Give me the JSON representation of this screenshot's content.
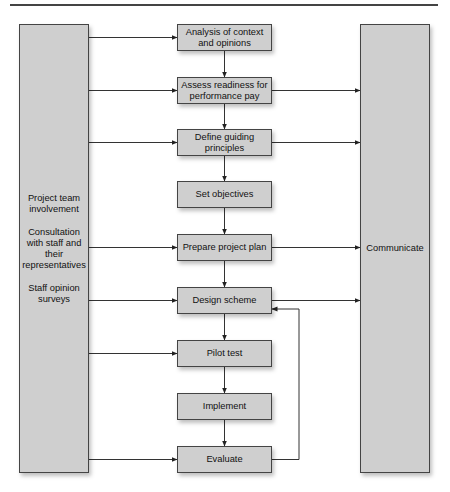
{
  "diagram": {
    "left_panel": {
      "groups": [
        {
          "lines": [
            "Project team",
            "involvement"
          ]
        },
        {
          "lines": [
            "Consultation",
            "with staff and",
            "their",
            "representatives"
          ]
        },
        {
          "lines": [
            "Staff opinion",
            "surveys"
          ]
        }
      ]
    },
    "right_panel": {
      "label": "Communicate"
    },
    "steps": [
      {
        "lines": [
          "Analysis of context",
          "and opinions"
        ],
        "top": 24,
        "from_left": true,
        "to_right": false
      },
      {
        "lines": [
          "Assess readiness for",
          "performance pay"
        ],
        "top": 77,
        "from_left": true,
        "to_right": true
      },
      {
        "lines": [
          "Define guiding",
          "principles"
        ],
        "top": 129,
        "from_left": true,
        "to_right": true
      },
      {
        "lines": [
          "Set objectives"
        ],
        "top": 181,
        "from_left": false,
        "to_right": false
      },
      {
        "lines": [
          "Prepare project plan"
        ],
        "top": 234,
        "from_left": true,
        "to_right": true
      },
      {
        "lines": [
          "Design scheme"
        ],
        "top": 287,
        "from_left": true,
        "to_right": true
      },
      {
        "lines": [
          "Pilot test"
        ],
        "top": 340,
        "from_left": true,
        "to_right": false
      },
      {
        "lines": [
          "Implement"
        ],
        "top": 393,
        "from_left": false,
        "to_right": false
      },
      {
        "lines": [
          "Evaluate"
        ],
        "top": 446,
        "from_left": true,
        "to_right": false
      }
    ],
    "feedback_loop": {
      "from": "Evaluate",
      "to": "Design scheme"
    },
    "colors": {
      "box_fill": "#cfcfcf",
      "border": "#444444",
      "line": "#333333"
    }
  }
}
